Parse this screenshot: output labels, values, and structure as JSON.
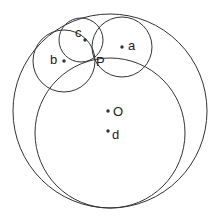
{
  "figure": {
    "canvas": {
      "width": 220,
      "height": 220
    },
    "style": {
      "background_color": "#ffffff",
      "stroke_color": "#333333",
      "label_color": "#222222",
      "stroke_width": 1
    }
  },
  "chart_data": {
    "type": "diagram",
    "subtype": "circle-geometry",
    "units": "pixels",
    "coordinate_system": "screen (origin top-left, y grows downward)",
    "circles": [
      {
        "id": "O",
        "label": "O",
        "role": "outer-large-circle",
        "center": {
          "x": 110,
          "y": 111
        },
        "radius": 97
      },
      {
        "id": "d",
        "label": "d",
        "role": "inner-large-circle",
        "center": {
          "x": 110,
          "y": 133
        },
        "radius": 75
      },
      {
        "id": "a",
        "label": "a",
        "role": "small-circle-right",
        "center": {
          "x": 122,
          "y": 47
        },
        "radius": 30
      },
      {
        "id": "b",
        "label": "b",
        "role": "small-circle-left",
        "center": {
          "x": 64,
          "y": 61
        },
        "radius": 31
      },
      {
        "id": "c",
        "label": "c",
        "role": "small-circle-top",
        "center": {
          "x": 81,
          "y": 40
        },
        "radius": 22
      }
    ],
    "points": [
      {
        "id": "P",
        "label": "P",
        "role": "common-intersection-point",
        "x": 92,
        "y": 62,
        "dot": false,
        "label_offset": {
          "dx": 4,
          "dy": 1
        }
      },
      {
        "id": "center-a",
        "label": "a",
        "role": "circle-center-marker",
        "x": 122,
        "y": 47,
        "dot": true,
        "label_offset": {
          "dx": 6,
          "dy": 0
        }
      },
      {
        "id": "center-b",
        "label": "b",
        "role": "circle-center-marker",
        "x": 64,
        "y": 61,
        "dot": true,
        "label_offset": {
          "dx": -14,
          "dy": 0
        }
      },
      {
        "id": "center-c",
        "label": "c",
        "role": "circle-center-marker",
        "x": 85,
        "y": 40,
        "dot": true,
        "label_offset": {
          "dx": -10,
          "dy": -6
        }
      },
      {
        "id": "center-O",
        "label": "O",
        "role": "circle-center-marker",
        "x": 108,
        "y": 111,
        "dot": true,
        "label_offset": {
          "dx": 5,
          "dy": 2
        }
      },
      {
        "id": "center-d",
        "label": "d",
        "role": "circle-center-marker",
        "x": 108,
        "y": 131,
        "dot": true,
        "label_offset": {
          "dx": 4,
          "dy": 5
        }
      }
    ],
    "labels": [
      "c",
      "a",
      "b",
      "P",
      "O",
      "d"
    ]
  }
}
